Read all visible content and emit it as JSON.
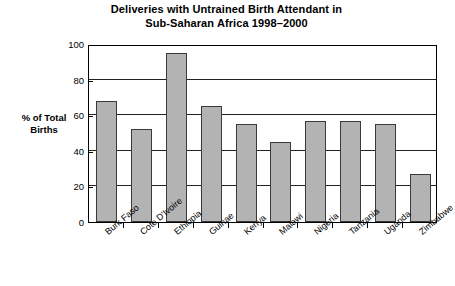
{
  "chart_data": {
    "type": "bar",
    "title": "Deliveries with Untrained Birth Attendant in Sub-Saharan Africa 1998–2000",
    "title_lines": [
      "Deliveries with Untrained Birth Attendant in",
      "Sub-Saharan Africa 1998–2000"
    ],
    "xlabel": "",
    "ylabel": "% of Total Births",
    "ylabel_lines": [
      "% of Total",
      "Births"
    ],
    "categories": [
      "Burk Faso",
      "Cote D'Ivoire",
      "Ethiopia",
      "Guinae",
      "Kenya",
      "Malawi",
      "Nigeria",
      "Tanzania",
      "Uganda",
      "Zimbabwe"
    ],
    "values": [
      68,
      52,
      95,
      65,
      55,
      45,
      57,
      57,
      55,
      27
    ],
    "ylim": [
      0,
      100
    ],
    "yticks": [
      0,
      20,
      40,
      60,
      80,
      100
    ],
    "ytick_labels": [
      "0",
      "20",
      "40",
      "60",
      "80",
      "100"
    ],
    "grid": true,
    "legend": false,
    "bar_color": "#b3b3b3",
    "bar_border_color": "#3a3a3a",
    "axis_color": "#000000",
    "background_color": "#ffffff"
  }
}
